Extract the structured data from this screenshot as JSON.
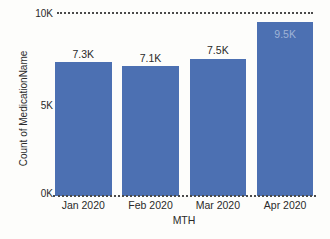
{
  "chart_data": {
    "type": "bar",
    "categories": [
      "Jan 2020",
      "Feb 2020",
      "Mar 2020",
      "Apr 2020"
    ],
    "values": [
      7300,
      7100,
      7500,
      9500
    ],
    "value_labels": [
      "7.3K",
      "7.1K",
      "7.5K",
      "9.5K"
    ],
    "label_inside": [
      false,
      false,
      false,
      true
    ],
    "title": "",
    "xlabel": "MTH",
    "ylabel": "Count of MedicationName",
    "ylim": [
      0,
      10000
    ],
    "yticks": [
      {
        "value": 0,
        "label": "0K"
      },
      {
        "value": 5000,
        "label": "5K"
      },
      {
        "value": 10000,
        "label": "10K"
      }
    ],
    "gridlines": {
      "style": "dotted",
      "at_values": [
        0,
        10000
      ]
    },
    "legend": "none",
    "colors": {
      "bar": "#4c70b2",
      "inside_label": "#9fb3d6",
      "text": "#2a2a2a",
      "grid_dots": "#4a4a4a",
      "background": "#fdfdfb"
    }
  }
}
